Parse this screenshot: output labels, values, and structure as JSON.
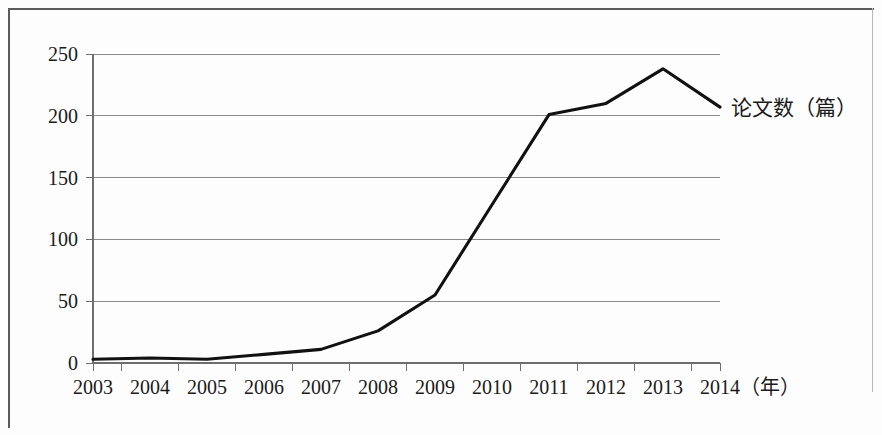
{
  "chart_data": {
    "type": "line",
    "title": "",
    "xlabel": "（年）",
    "ylabel": "",
    "categories": [
      "2003",
      "2004",
      "2005",
      "2006",
      "2007",
      "2008",
      "2009",
      "2010",
      "2011",
      "2012",
      "2013",
      "2014"
    ],
    "series": [
      {
        "name": "论文数（篇）",
        "values": [
          3,
          4,
          3,
          7,
          11,
          26,
          55,
          128,
          201,
          210,
          238,
          207
        ]
      }
    ],
    "ylim": [
      0,
      250
    ],
    "y_ticks": [
      "0",
      "50",
      "100",
      "150",
      "200",
      "250"
    ],
    "y_tick_values": [
      0,
      50,
      100,
      150,
      200,
      250
    ],
    "grid": "horizontal",
    "legend_position": "right-inline",
    "line_color": "#111111",
    "grid_color": "#8a8a8a",
    "axis_color": "#6e6e6e"
  },
  "legend": {
    "series_label": "论文数（篇）"
  },
  "axes": {
    "x_unit_label": "（年）"
  }
}
